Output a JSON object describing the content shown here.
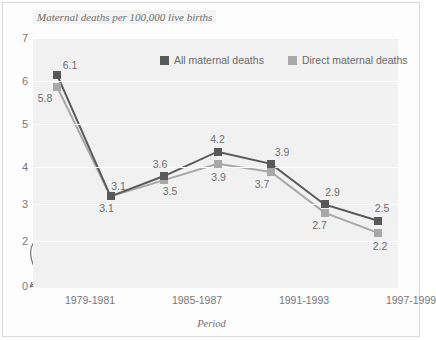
{
  "chart_data": {
    "type": "line",
    "title": "Maternal deaths per 100,000 live births",
    "xlabel": "Period",
    "ylabel": "",
    "x_tick_labels": [
      "1979-1981",
      "1985-1987",
      "1991-1993",
      "1997-1999"
    ],
    "y_tick_labels": [
      "7",
      "6",
      "5",
      "4",
      "3",
      "2",
      "0"
    ],
    "ylim": [
      2,
      7
    ],
    "y_axis_break": true,
    "grid": true,
    "legend_position": "top-center",
    "categories": [
      "1979-1981",
      "1982-1984",
      "1985-1987",
      "1988-1990",
      "1991-1993",
      "1994-1996",
      "1997-1999"
    ],
    "series": [
      {
        "name": "All maternal deaths",
        "color": "#595959",
        "values": [
          6.1,
          3.1,
          3.6,
          4.2,
          3.9,
          2.9,
          2.5
        ],
        "labels": [
          "6.1",
          "3.1",
          "3.6",
          "4.2",
          "3.9",
          "2.9",
          "2.5"
        ]
      },
      {
        "name": "Direct maternal deaths",
        "color": "#a8a8a8",
        "values": [
          5.8,
          3.1,
          3.5,
          3.9,
          3.7,
          2.7,
          2.2
        ],
        "labels": [
          "5.8",
          "3.1",
          "3.5",
          "3.9",
          "3.7",
          "2.7",
          "2.2"
        ]
      }
    ]
  },
  "legend": {
    "items": [
      {
        "label": "All maternal deaths",
        "color": "#595959"
      },
      {
        "label": "Direct maternal deaths",
        "color": "#a8a8a8"
      }
    ]
  },
  "axes": {
    "y_ticks": [
      {
        "label": "7",
        "y": 0
      },
      {
        "label": "6",
        "y": 43
      },
      {
        "label": "5",
        "y": 86
      },
      {
        "label": "4",
        "y": 129
      },
      {
        "label": "3",
        "y": 166
      },
      {
        "label": "2",
        "y": 203
      },
      {
        "label": "0",
        "y": 248
      }
    ],
    "x_ticks": [
      {
        "label": "1979-1981",
        "x": 57
      },
      {
        "label": "1985-1987",
        "x": 164
      },
      {
        "label": "1991-1993",
        "x": 271
      },
      {
        "label": "1997-1999",
        "x": 378
      }
    ]
  }
}
